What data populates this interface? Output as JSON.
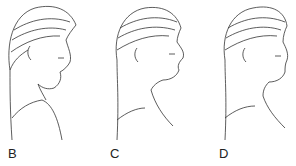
{
  "figures": [
    {
      "label": "B",
      "left": 0,
      "label_x": 8
    },
    {
      "label": "C",
      "left": 105,
      "label_x": 110
    },
    {
      "label": "D",
      "left": 215,
      "label_x": 219
    }
  ],
  "colors": {
    "ink": "#333333",
    "background": "#ffffff"
  }
}
